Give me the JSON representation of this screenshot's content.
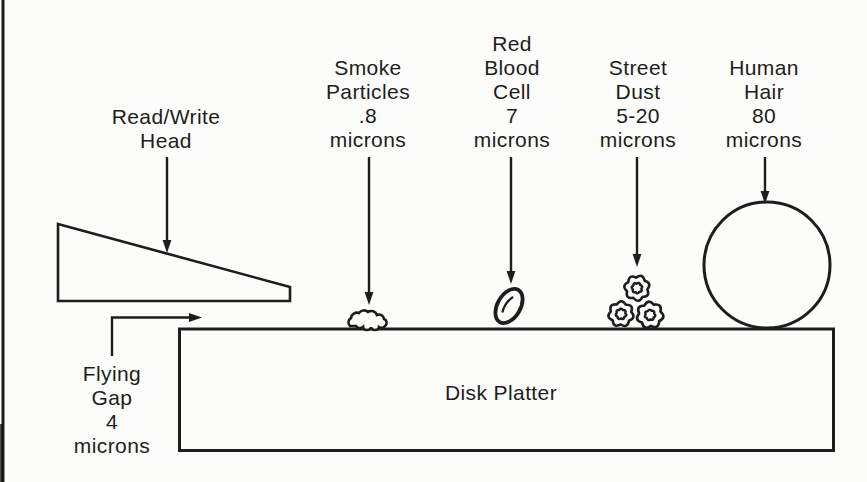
{
  "page": {
    "background": "#fcfcfa",
    "ink": "#1d1d1d"
  },
  "diagram": {
    "labels": {
      "read_write_head": {
        "lines": [
          "Read/Write",
          "Head"
        ]
      },
      "smoke_particles": {
        "lines": [
          "Smoke",
          "Particles",
          ".8",
          "microns"
        ]
      },
      "red_blood_cell": {
        "lines": [
          "Red",
          "Blood",
          "Cell",
          "7",
          "microns"
        ]
      },
      "street_dust": {
        "lines": [
          "Street",
          "Dust",
          "5-20",
          "microns"
        ]
      },
      "human_hair": {
        "lines": [
          "Human",
          "Hair",
          "80",
          "microns"
        ]
      },
      "flying_gap": {
        "lines": [
          "Flying",
          "Gap",
          "4",
          "microns"
        ]
      },
      "disk_platter": {
        "text": "Disk Platter"
      }
    }
  }
}
